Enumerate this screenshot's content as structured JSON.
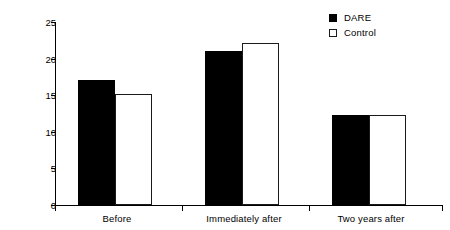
{
  "chart_data": {
    "type": "bar",
    "title": "",
    "subtitle": "",
    "xlabel": "",
    "ylabel": "Per cent",
    "categories": [
      "Before",
      "Immediately after",
      "Two years after"
    ],
    "series": [
      {
        "name": "DARE",
        "values": [
          17.1,
          21.1,
          12.3
        ],
        "color": "#000000",
        "marker": "filled-square"
      },
      {
        "name": "Control",
        "values": [
          15.1,
          22.1,
          12.3
        ],
        "color": "#ffffff",
        "marker": "open-square"
      }
    ],
    "ylim": [
      0,
      25
    ],
    "ytick_values": [
      0,
      5,
      10,
      15,
      20,
      25
    ],
    "ytick_labels": [
      "0",
      "5",
      "10",
      "15",
      "20",
      "25"
    ],
    "grid": false,
    "legend_position": "top-right",
    "annotations": []
  },
  "legend": {
    "entries": [
      {
        "label": "DARE",
        "swatch": "filled-square-swatch"
      },
      {
        "label": "Control",
        "swatch": "open-square-swatch"
      }
    ]
  },
  "axes": {
    "y_label": "Per cent",
    "y_ticks": [
      "25",
      "20",
      "15",
      "10",
      "5",
      "0"
    ],
    "x_categories": [
      "Before",
      "Immediately after",
      "Two years after"
    ]
  }
}
